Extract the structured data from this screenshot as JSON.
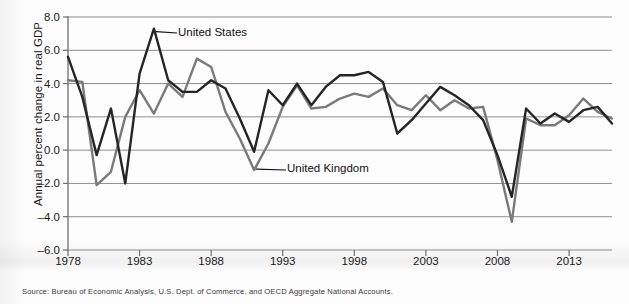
{
  "chart_data": {
    "type": "line",
    "title": "",
    "xlabel": "",
    "ylabel": "Annual percent change in real GDP",
    "xlim": [
      1978,
      2016
    ],
    "ylim": [
      -6.0,
      8.0
    ],
    "grid": true,
    "legend": "inline-annotations",
    "x": [
      1978,
      1979,
      1980,
      1981,
      1982,
      1983,
      1984,
      1985,
      1986,
      1987,
      1988,
      1989,
      1990,
      1991,
      1992,
      1993,
      1994,
      1995,
      1996,
      1997,
      1998,
      1999,
      2000,
      2001,
      2002,
      2003,
      2004,
      2005,
      2006,
      2007,
      2008,
      2009,
      2010,
      2011,
      2012,
      2013,
      2014,
      2015,
      2016
    ],
    "x_tick_labels": [
      "1978",
      "1983",
      "1988",
      "1993",
      "1998",
      "2003",
      "2008",
      "2013"
    ],
    "x_tick_values": [
      1978,
      1983,
      1988,
      1993,
      1998,
      2003,
      2008,
      2013
    ],
    "y_tick_labels": [
      "8.0",
      "6.0",
      "4.0",
      "2.0",
      "0.0",
      "-2.0",
      "-4.0",
      "-6.0"
    ],
    "y_tick_values": [
      8.0,
      6.0,
      4.0,
      2.0,
      0.0,
      -2.0,
      -4.0,
      -6.0
    ],
    "series": [
      {
        "name": "United States",
        "color": "#252525",
        "values": [
          5.6,
          3.2,
          -0.3,
          2.5,
          -2.0,
          4.6,
          7.3,
          4.2,
          3.5,
          3.5,
          4.2,
          3.7,
          1.9,
          -0.1,
          3.6,
          2.7,
          4.0,
          2.7,
          3.8,
          4.5,
          4.5,
          4.7,
          4.1,
          1.0,
          1.8,
          2.8,
          3.8,
          3.3,
          2.7,
          1.8,
          -0.3,
          -2.8,
          2.5,
          1.6,
          2.2,
          1.7,
          2.4,
          2.6,
          1.6
        ]
      },
      {
        "name": "United Kingdom",
        "color": "#7a7a7a",
        "values": [
          4.2,
          4.1,
          -2.1,
          -1.3,
          2.0,
          3.6,
          2.2,
          4.0,
          3.2,
          5.5,
          5.0,
          2.3,
          0.7,
          -1.2,
          0.4,
          2.6,
          3.9,
          2.5,
          2.6,
          3.1,
          3.4,
          3.2,
          3.7,
          2.7,
          2.4,
          3.3,
          2.4,
          3.0,
          2.5,
          2.6,
          -0.6,
          -4.3,
          1.9,
          1.5,
          1.5,
          2.1,
          3.1,
          2.3,
          1.9
        ]
      }
    ],
    "annotations": [
      {
        "id": "us-label",
        "text": "United States",
        "x": 1984,
        "y": 7.3
      },
      {
        "id": "uk-label",
        "text": "United Kingdom",
        "x": 1991,
        "y": -1.2
      }
    ],
    "source": "Source: Bureau of Economic Analysis, U.S. Dept. of Commerce, and OECD Aggregate National Accounts."
  }
}
